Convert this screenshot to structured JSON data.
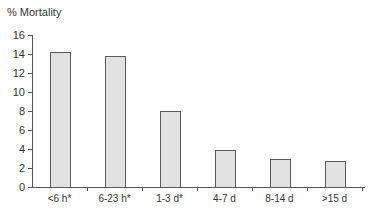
{
  "chart_data": {
    "type": "bar",
    "title": "",
    "ylabel": "% Mortality",
    "xlabel": "",
    "categories": [
      "<6 h*",
      "6-23 h*",
      "1-3 d*",
      "4-7 d",
      "8-14 d",
      ">15 d"
    ],
    "values": [
      14.2,
      13.8,
      8.0,
      3.9,
      3.0,
      2.7
    ],
    "ylim": [
      0,
      16
    ],
    "yticks": [
      0,
      2,
      4,
      6,
      8,
      10,
      12,
      14,
      16
    ],
    "grid": false,
    "legend": null,
    "colors": {
      "bar_fill": "#e2e2e2",
      "bar_edge": "#5a5a5a",
      "axis": "#555555"
    }
  },
  "labels": {
    "y_title": "% Mortality",
    "y_ticks": [
      "0",
      "2",
      "4",
      "6",
      "8",
      "10",
      "12",
      "14",
      "16"
    ],
    "x_ticks": [
      "<6 h*",
      "6-23 h*",
      "1-3 d*",
      "4-7 d",
      "8-14 d",
      ">15 d"
    ]
  }
}
